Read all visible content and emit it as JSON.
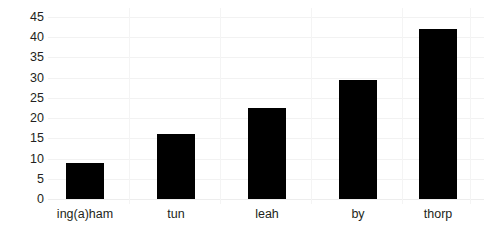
{
  "chart_data": {
    "type": "bar",
    "title": "",
    "subtitle": "",
    "xlabel": "",
    "ylabel": "",
    "categories": [
      "ing(a)ham",
      "tun",
      "leah",
      "by",
      "thorp"
    ],
    "values": [
      9,
      16,
      22.5,
      29.5,
      42
    ],
    "series": [
      {
        "name": "",
        "values": [
          9,
          16,
          22.5,
          29.5,
          42
        ]
      }
    ],
    "ylim": [
      0,
      45
    ],
    "xlim": null,
    "ytick_labels": [
      "0",
      "5",
      "10",
      "15",
      "20",
      "25",
      "30",
      "35",
      "40",
      "45"
    ],
    "ytick_values": [
      0,
      5,
      10,
      15,
      20,
      25,
      30,
      35,
      40,
      45
    ],
    "ytick_step": 5,
    "grid": true,
    "grid_axis": "y",
    "legend": false,
    "legend_position": "none",
    "annotations": [],
    "bar_color": "#000000",
    "background_color": "#ffffff",
    "gridline_color": "#f2f2f2",
    "text_color": "#231f20"
  }
}
